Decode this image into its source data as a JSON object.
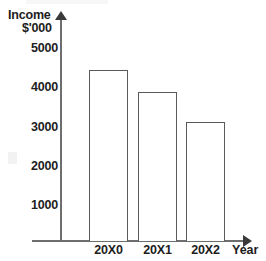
{
  "chart_data": {
    "type": "bar",
    "title": "",
    "categories": [
      "20X0",
      "20X1",
      "20X2"
    ],
    "values": [
      4440,
      3880,
      3115
    ],
    "xlabel": "Year",
    "ylabel": "Income",
    "yunit": "$'000",
    "ylim": [
      0,
      5400
    ],
    "yticks": [
      1000,
      2000,
      3000,
      4000,
      5000
    ],
    "ytick_labels": [
      "1000",
      "2000",
      "3000",
      "4000",
      "5000"
    ],
    "grid": false,
    "legend": false,
    "bar_fill_color": "#ffffff",
    "bar_edge_color": "#5a5a5a",
    "axis_color": "#6e6e6e",
    "text_color": "#1d1d1d",
    "background_color": "#ffffff",
    "axis_arrows": true,
    "series": [
      {
        "name": "Income",
        "values": [
          4440,
          3880,
          3115
        ]
      }
    ]
  }
}
